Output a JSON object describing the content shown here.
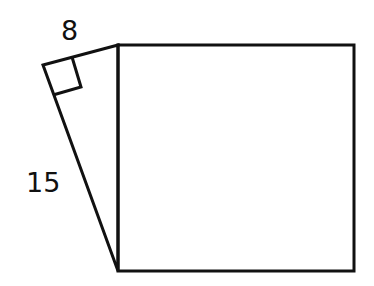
{
  "diagram": {
    "type": "geometry",
    "labels": {
      "leg_short": "8",
      "leg_long": "15"
    },
    "shapes": {
      "square": {
        "side": "hypotenuse of triangle"
      },
      "triangle": {
        "right_angle_marker": true
      }
    },
    "colors": {
      "stroke": "#111111",
      "background": "#ffffff"
    }
  }
}
